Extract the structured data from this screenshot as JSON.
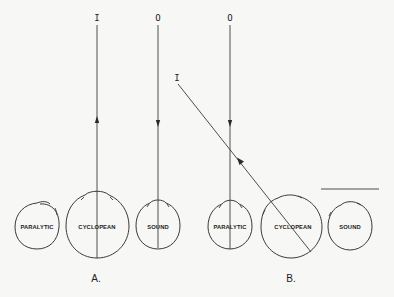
{
  "figure": {
    "panel_a": {
      "label": "A.",
      "input_marker": "I",
      "output_marker": "O",
      "eyes": {
        "paralytic": "PARALYTIC",
        "cyclopean": "CYCLOPEAN",
        "sound": "SOUND"
      }
    },
    "panel_b": {
      "label": "B.",
      "input_marker": "I",
      "output_marker": "O",
      "eyes": {
        "paralytic": "PARALYTIC",
        "cyclopean": "CYCLOPEAN",
        "sound": "SOUND"
      }
    },
    "colors": {
      "background": "#f7f7f5",
      "ink": "#3a3a3a"
    }
  }
}
